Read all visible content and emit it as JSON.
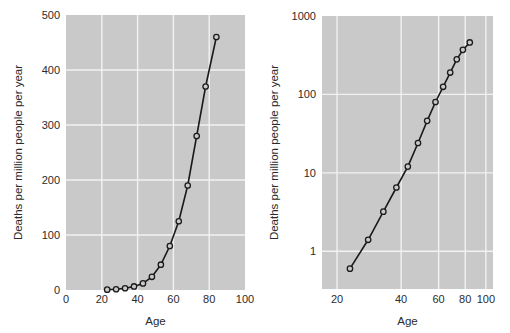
{
  "figure": {
    "background": "#ffffff",
    "panel_background": "#c9c9c9",
    "grid_color": "#f2f2f2",
    "line_color": "#1a1a1a",
    "marker_face": "#c9c9c9",
    "text_color": "#2b2b2b"
  },
  "chart_data": [
    {
      "type": "line",
      "id": "linear-panel",
      "title": "",
      "xlabel": "Age",
      "ylabel": "Deaths per million people per year",
      "xscale": "linear",
      "yscale": "linear",
      "xlim": [
        0,
        100
      ],
      "ylim": [
        0,
        500
      ],
      "xticks": [
        0,
        20,
        40,
        60,
        80,
        100
      ],
      "xticklabels": [
        "0",
        "20",
        "40",
        "60",
        "80",
        "100"
      ],
      "yticks": [
        0,
        100,
        200,
        300,
        400,
        500
      ],
      "yticklabels": [
        "0",
        "100",
        "200",
        "300",
        "400",
        "500"
      ],
      "grid": true,
      "legend": "none",
      "series": [
        {
          "name": "deaths-by-age",
          "marker": "circle-open",
          "x": [
            23,
            28,
            33,
            38,
            43,
            48,
            53,
            58,
            63,
            68,
            73,
            78,
            84
          ],
          "y": [
            0.6,
            1.4,
            3.2,
            6.5,
            12,
            24,
            46,
            80,
            125,
            190,
            280,
            370,
            460
          ]
        }
      ]
    },
    {
      "type": "line",
      "id": "loglog-panel",
      "title": "",
      "xlabel": "Age",
      "ylabel": "Deaths per million people per year",
      "xscale": "log",
      "yscale": "log",
      "xlim": [
        17,
        108
      ],
      "ylim": [
        0.33,
        1000
      ],
      "xticks": [
        20,
        40,
        60,
        80,
        100
      ],
      "xticklabels": [
        "20",
        "40",
        "60",
        "80",
        "100"
      ],
      "yticks": [
        1,
        10,
        100,
        1000
      ],
      "yticklabels": [
        "1",
        "10",
        "100",
        "1000"
      ],
      "grid": true,
      "legend": "none",
      "series": [
        {
          "name": "deaths-by-age",
          "marker": "circle-open",
          "x": [
            23,
            28,
            33,
            38,
            43,
            48,
            53,
            58,
            63,
            68,
            73,
            78,
            84
          ],
          "y": [
            0.6,
            1.4,
            3.2,
            6.5,
            12,
            24,
            46,
            80,
            125,
            190,
            280,
            370,
            460
          ]
        }
      ]
    }
  ]
}
